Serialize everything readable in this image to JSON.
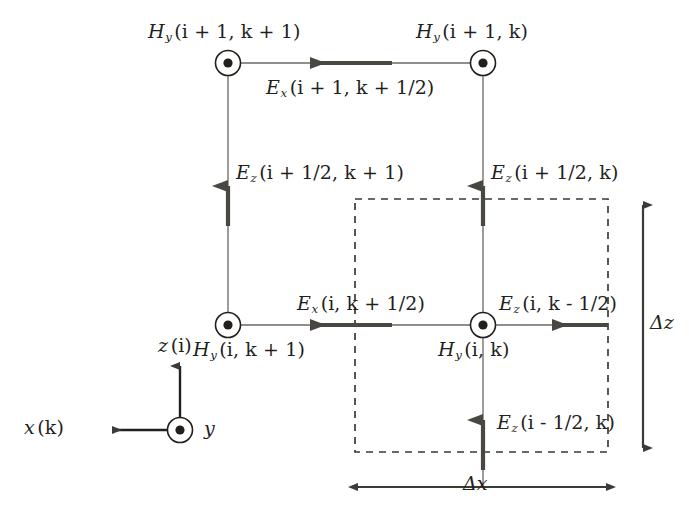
{
  "figure": {
    "colors": {
      "ink": "#231f1c",
      "thin_line": "#6b6862",
      "thick_arrow": "#4a4743",
      "dashed": "#3c3a36",
      "background": "#ffffff"
    }
  },
  "nodes": {
    "top_left": {
      "name": "Hy(i+1,k+1)",
      "sym": "H",
      "sub": "y",
      "args": "(i + 1, k + 1)",
      "cx": 228,
      "cy": 63
    },
    "top_right": {
      "name": "Hy(i+1,k)",
      "sym": "H",
      "sub": "y",
      "args": "(i + 1, k)",
      "cx": 483,
      "cy": 63
    },
    "bottom_left": {
      "name": "Hy(i,k+1)",
      "sym": "H",
      "sub": "y",
      "args": "(i, k + 1)",
      "cx": 228,
      "cy": 325
    },
    "bottom_right": {
      "name": "Hy(i,k)",
      "sym": "H",
      "sub": "y",
      "args": "(i, k)",
      "cx": 483,
      "cy": 325
    }
  },
  "field_labels": {
    "ex_top": {
      "sym": "E",
      "sub": "x",
      "args": "(i + 1, k + 1/2)"
    },
    "ex_mid": {
      "sym": "E",
      "sub": "x",
      "args": "(i, k + 1/2)"
    },
    "ez_left": {
      "sym": "E",
      "sub": "z",
      "args": "(i + 1/2, k + 1)"
    },
    "ez_right": {
      "sym": "E",
      "sub": "z",
      "args": "(i + 1/2, k)"
    },
    "ez_node_right": {
      "sym": "E",
      "sub": "z",
      "args": "(i, k - 1/2)"
    },
    "ez_bottom": {
      "sym": "E",
      "sub": "z",
      "args": "(i - 1/2, k)"
    }
  },
  "axes": {
    "z_label": {
      "sym": "z",
      "args": "(i)"
    },
    "x_label": {
      "sym": "x",
      "args": "(k)"
    },
    "y_label": {
      "sym": "y",
      "args": ""
    },
    "origin_cx": 180,
    "origin_cy": 430
  },
  "dimensions": {
    "delta_z": "Δz",
    "delta_x": "Δx"
  },
  "cell": {
    "dashed_rect": {
      "x": 355,
      "y": 199,
      "w": 253,
      "h": 253
    }
  }
}
